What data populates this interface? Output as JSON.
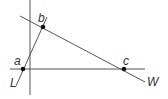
{
  "diagram": {
    "type": "geometry-lines-and-points",
    "points": [
      {
        "label": "a",
        "x": 23,
        "y": 69
      },
      {
        "label": "b",
        "x": 43,
        "y": 27
      },
      {
        "label": "c",
        "x": 124,
        "y": 69
      }
    ],
    "lines": [
      {
        "label": "L",
        "through": [
          "a",
          "b"
        ]
      },
      {
        "label": "W",
        "through": [
          "b",
          "c"
        ]
      },
      {
        "label": "",
        "description": "horizontal line through a and c"
      },
      {
        "label": "",
        "description": "vertical line"
      }
    ],
    "labels": {
      "a": "a",
      "b": "b",
      "c": "c",
      "L": "L",
      "W": "W"
    },
    "colors": {
      "line": "#555555",
      "point": "#111111",
      "text": "#333333"
    }
  }
}
